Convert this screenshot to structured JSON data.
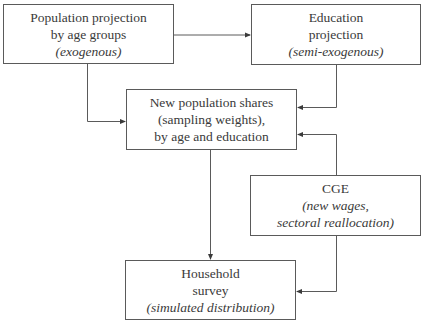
{
  "diagram": {
    "boxes": {
      "population": {
        "line1": "Population projection",
        "line2": "by age groups",
        "note": "(exogenous)"
      },
      "education": {
        "line1": "Education",
        "line2": "projection",
        "note": "(semi-exogenous)"
      },
      "shares": {
        "line1": "New population shares",
        "line2": "(sampling weights),",
        "line3": "by age and education"
      },
      "cge": {
        "line1": "CGE",
        "note1": "(new wages,",
        "note2": "sectoral reallocation)"
      },
      "household": {
        "line1": "Household",
        "line2": "survey",
        "note": "(simulated distribution)"
      }
    },
    "edges": [
      {
        "from": "population",
        "to": "education"
      },
      {
        "from": "population",
        "to": "shares"
      },
      {
        "from": "education",
        "to": "shares"
      },
      {
        "from": "cge",
        "to": "shares"
      },
      {
        "from": "shares",
        "to": "household"
      },
      {
        "from": "cge",
        "to": "household"
      }
    ],
    "colors": {
      "line": "#5a5a5a",
      "text": "#3a3a3a",
      "background": "#ffffff"
    }
  }
}
